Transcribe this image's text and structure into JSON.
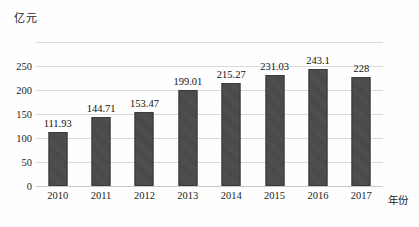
{
  "chart_data": {
    "type": "bar",
    "title": "",
    "subtitle": "",
    "xlabel": "年份",
    "ylabel": "亿元",
    "categories": [
      "2010",
      "2011",
      "2012",
      "2013",
      "2014",
      "2015",
      "2016",
      "2017"
    ],
    "values": [
      111.93,
      144.71,
      153.47,
      199.01,
      215.27,
      231.03,
      243.1,
      228
    ],
    "value_labels": [
      "111.93",
      "144.71",
      "153.47",
      "199.01",
      "215.27",
      "231.03",
      "243.1",
      "228"
    ],
    "ylim": [
      0,
      300
    ],
    "y_ticks": [
      0,
      50,
      100,
      150,
      200,
      250,
      300
    ],
    "y_tick_labels": [
      "0",
      "50",
      "100",
      "150",
      "200",
      "250",
      ""
    ],
    "grid": true,
    "legend": null,
    "legend_position": "none",
    "series": [
      {
        "name": "",
        "values": [
          111.93,
          144.71,
          153.47,
          199.01,
          215.27,
          231.03,
          243.1,
          228
        ]
      }
    ],
    "annotations": []
  },
  "style": {
    "bar_color": "#474747",
    "bar_edge_color": "#3b3b3b",
    "grid_color": "#d9d9d9",
    "axis_color": "#c9c9c9",
    "text_color": "#1c1c1c",
    "background": "#fefefe"
  }
}
